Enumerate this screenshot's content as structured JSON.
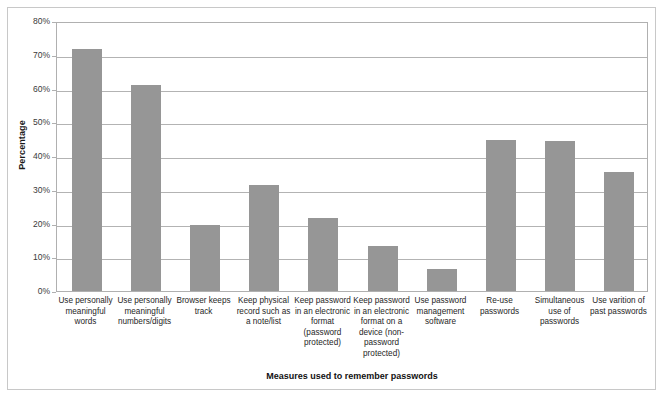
{
  "chart_data": {
    "type": "bar",
    "title": "",
    "xlabel": "Measures used to remember passwords",
    "ylabel": "Percentage",
    "ylim": [
      0,
      80
    ],
    "ytick_labels": [
      "0%",
      "10%",
      "20%",
      "30%",
      "40%",
      "50%",
      "60%",
      "70%",
      "80%"
    ],
    "ytick_values": [
      0,
      10,
      20,
      30,
      40,
      50,
      60,
      70,
      80
    ],
    "grid": true,
    "legend": "none",
    "bar_color": "#969696",
    "categories": [
      "Use personally meaningful words",
      "Use personally meaningful numbers/digits",
      "Browser keeps track",
      "Keep physical record such as a note/list",
      "Keep password in an electronic format (password protected)",
      "Keep password in an electronic format on a device (non-password protected)",
      "Use password management software",
      "Re-use passwords",
      "Simultaneous use of passwords",
      "Use varition of past passwords"
    ],
    "values": [
      71.8,
      61.0,
      19.5,
      31.5,
      21.5,
      13.2,
      6.5,
      44.8,
      44.4,
      35.3
    ]
  },
  "axes": {
    "y_title": "Percentage",
    "x_title": "Measures used to remember passwords"
  }
}
